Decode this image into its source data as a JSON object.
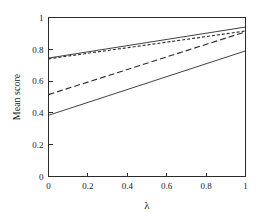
{
  "chart_data": {
    "type": "line",
    "title": "",
    "subtitle": "",
    "xlabel": "λ",
    "ylabel": "Mean score",
    "xlim": [
      0,
      1
    ],
    "ylim": [
      0,
      1
    ],
    "xticks": [
      0,
      0.2,
      0.4,
      0.6,
      0.8,
      1
    ],
    "yticks": [
      0,
      0.2,
      0.4,
      0.6,
      0.8,
      1
    ],
    "xticklabels": [
      "0",
      "0.2",
      "0.4",
      "0.6",
      "0.8",
      "1"
    ],
    "yticklabels": [
      "0",
      "0.2",
      "0.4",
      "0.6",
      "0.8",
      "1"
    ],
    "grid": false,
    "legend": "none",
    "frame": "box",
    "line_color": "#2b2b2b",
    "background_color": "#ffffff",
    "x": [
      0,
      1
    ],
    "series": [
      {
        "name": "series-1-solid-upper",
        "style": "solid",
        "dash": "none",
        "values": [
          0.745,
          0.94
        ]
      },
      {
        "name": "series-2-short-dash",
        "style": "dashed",
        "dash": "short",
        "values": [
          0.74,
          0.915
        ]
      },
      {
        "name": "series-3-long-dash",
        "style": "dashed",
        "dash": "long",
        "values": [
          0.515,
          0.91
        ]
      },
      {
        "name": "series-4-solid-lower",
        "style": "solid",
        "dash": "none",
        "values": [
          0.385,
          0.79
        ]
      }
    ]
  }
}
